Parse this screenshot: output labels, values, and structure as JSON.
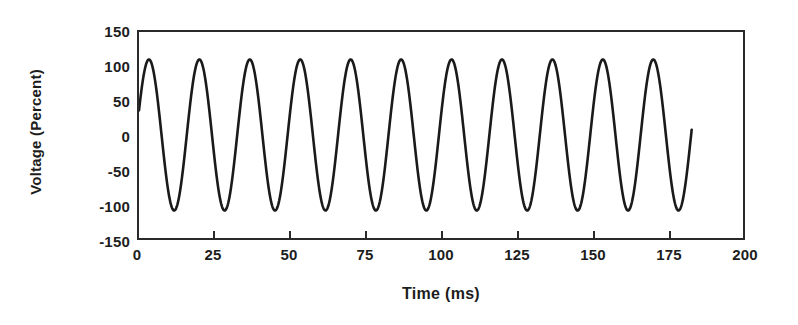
{
  "chart_data": {
    "type": "line",
    "title": "",
    "subtitle": "",
    "xlabel": "Time (ms)",
    "ylabel": "Voltage (Percent)",
    "xlim": [
      0,
      200
    ],
    "ylim": [
      -150,
      150
    ],
    "xticks": [
      0,
      25,
      50,
      75,
      100,
      125,
      150,
      175,
      200
    ],
    "xtick_labels": [
      "0",
      "25",
      "50",
      "75",
      "100",
      "125",
      "150",
      "175",
      "200"
    ],
    "yticks": [
      -150,
      -100,
      -50,
      0,
      50,
      100,
      150
    ],
    "ytick_labels": [
      "-150",
      "-100",
      "-50",
      "0",
      "50",
      "100",
      "150"
    ],
    "grid": false,
    "legend": null,
    "line_color": "#1a1a1a",
    "line_width": 2.6,
    "series": [
      {
        "name": "Voltage",
        "description": "Sinusoidal AC voltage waveform, about 60 Hz (period ~16.7 ms), amplitude ~110 percent, 11 full cycles shown, trace starts at t=0 near +35 percent and ends at t~183 ms near -25 percent",
        "amplitude": 110,
        "period_ms": 16.7,
        "frequency_hz": 60,
        "phase_deg": 19,
        "t_start": 0,
        "t_end": 183,
        "peaks_ms": [
          3.5,
          20.2,
          36.9,
          53.6,
          70.2,
          86.9,
          103.6,
          120.3,
          137.0,
          153.6,
          170.3
        ],
        "troughs_ms": [
          11.9,
          28.6,
          45.2,
          61.9,
          78.6,
          95.3,
          111.9,
          128.6,
          145.3,
          162.0,
          178.6
        ],
        "peak_value": 110,
        "trough_value": -110
      }
    ]
  }
}
